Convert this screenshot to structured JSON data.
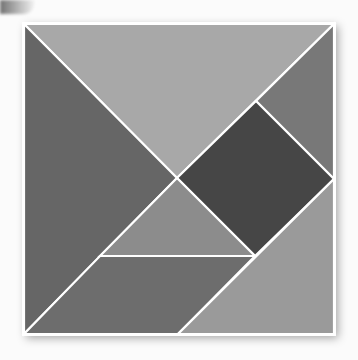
{
  "diagram": {
    "type": "tangram-square",
    "board": {
      "x": 24,
      "y": 24,
      "size": 310,
      "border_color": "#ffffff"
    },
    "pieces": [
      {
        "name": "large-triangle-top",
        "points": "24,24 334,24 177,178",
        "fill": "#a8a8a8"
      },
      {
        "name": "large-triangle-left",
        "points": "24,24 177,178 24,334",
        "fill": "#666666"
      },
      {
        "name": "small-triangle-right",
        "points": "334,24 334,179 256,101",
        "fill": "#787878"
      },
      {
        "name": "square",
        "points": "256,101 334,179 255,256 177,178",
        "fill": "#464646"
      },
      {
        "name": "small-triangle-middle",
        "points": "177,178 255,256 100,256",
        "fill": "#8c8c8c"
      },
      {
        "name": "parallelogram",
        "points": "100,256 255,256 178,334 24,334",
        "fill": "#6d6d6d"
      },
      {
        "name": "medium-triangle-bottom-right",
        "points": "334,179 334,334 178,334",
        "fill": "#9a9a9a"
      }
    ]
  }
}
